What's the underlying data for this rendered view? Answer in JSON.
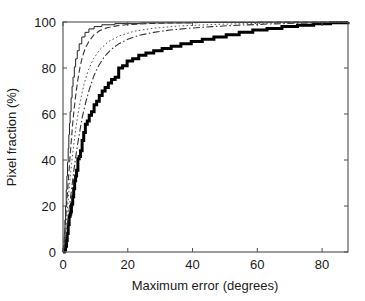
{
  "chart_data": {
    "type": "line",
    "title": "",
    "xlabel": "Maximum error (degrees)",
    "ylabel": "Pixel fraction (%)",
    "xlim": [
      0,
      88
    ],
    "ylim": [
      0,
      100
    ],
    "xticks": [
      0,
      20,
      40,
      60,
      80
    ],
    "yticks": [
      0,
      20,
      40,
      60,
      80,
      100
    ],
    "xticklabels": [
      "0",
      "20",
      "40",
      "60",
      "80"
    ],
    "yticklabels": [
      "0",
      "20",
      "40",
      "60",
      "80",
      "100"
    ],
    "grid": false,
    "legend": "none",
    "box": true,
    "series": [
      {
        "name": "thick-solid-staircase",
        "style": "solid",
        "width": 3.0,
        "color": "#000000",
        "step": true,
        "x": [
          0.0,
          0.4,
          0.8,
          1.1,
          1.3,
          1.6,
          1.9,
          2.2,
          2.4,
          2.6,
          2.8,
          3.0,
          3.3,
          3.6,
          3.9,
          4.2,
          4.6,
          5.0,
          5.4,
          5.9,
          6.4,
          6.9,
          7.5,
          8.1,
          8.8,
          9.6,
          10.4,
          11.2,
          12.1,
          13.0,
          14.0,
          15.0,
          16.1,
          17.2,
          18.4,
          19.8,
          21.5,
          23.4,
          25.6,
          28.0,
          30.6,
          33.4,
          36.4,
          39.6,
          43.0,
          46.6,
          50.4,
          54.4,
          58.6,
          63.0,
          67.6,
          72.4,
          77.4,
          82.6,
          88.0
        ],
        "y": [
          0.0,
          1.0,
          2.5,
          5.0,
          8.0,
          12.0,
          15.5,
          16.5,
          17.5,
          20.5,
          21.0,
          24.0,
          27.5,
          31.0,
          33.0,
          35.5,
          40.5,
          41.5,
          44.0,
          48.5,
          52.0,
          55.5,
          57.0,
          59.5,
          61.0,
          64.0,
          65.5,
          68.0,
          70.0,
          71.5,
          73.5,
          75.0,
          76.0,
          80.0,
          81.0,
          83.0,
          84.0,
          85.5,
          86.5,
          87.5,
          88.5,
          89.5,
          90.5,
          91.5,
          92.5,
          93.5,
          94.5,
          95.5,
          96.5,
          97.2,
          98.0,
          98.6,
          99.2,
          99.7,
          100.0
        ]
      },
      {
        "name": "thin-solid",
        "style": "solid",
        "width": 1.0,
        "color": "#222222",
        "step": true,
        "x": [
          0.0,
          0.2,
          0.4,
          0.6,
          0.8,
          1.0,
          1.2,
          1.4,
          1.6,
          1.8,
          2.0,
          2.2,
          2.5,
          2.8,
          3.1,
          3.5,
          3.9,
          4.4,
          5.0,
          5.8,
          6.8,
          8.0,
          9.6,
          12.0,
          16.0,
          24.0,
          40.0,
          60.0,
          88.0
        ],
        "y": [
          0.0,
          3.0,
          8.0,
          14.0,
          20.0,
          27.0,
          33.0,
          39.0,
          45.0,
          51.0,
          56.0,
          61.0,
          67.0,
          72.0,
          76.0,
          80.5,
          84.0,
          87.5,
          90.5,
          93.5,
          95.5,
          97.0,
          98.0,
          98.8,
          99.3,
          99.6,
          99.8,
          99.9,
          100.0
        ]
      },
      {
        "name": "dashed",
        "style": "dashed",
        "width": 1.1,
        "color": "#333333",
        "step": false,
        "x": [
          0.0,
          0.3,
          0.6,
          1.0,
          1.4,
          1.8,
          2.2,
          2.6,
          3.0,
          3.5,
          4.0,
          4.6,
          5.2,
          6.0,
          7.0,
          8.2,
          9.6,
          11.4,
          13.6,
          16.5,
          20.0,
          26.0,
          34.0,
          45.0,
          60.0,
          75.0,
          88.0
        ],
        "y": [
          0.0,
          4.0,
          10.0,
          18.0,
          26.0,
          34.0,
          42.0,
          49.0,
          56.0,
          63.0,
          69.0,
          75.0,
          80.0,
          85.0,
          89.0,
          92.0,
          94.5,
          96.3,
          97.5,
          98.3,
          98.9,
          99.3,
          99.6,
          99.8,
          99.9,
          99.95,
          100.0
        ]
      },
      {
        "name": "dash-dot",
        "style": "dashdot",
        "width": 1.1,
        "color": "#333333",
        "step": false,
        "x": [
          0.0,
          0.5,
          1.0,
          1.6,
          2.2,
          2.8,
          3.5,
          4.2,
          5.0,
          6.0,
          7.0,
          8.2,
          9.5,
          11.0,
          12.8,
          14.8,
          17.2,
          20.0,
          23.5,
          28.0,
          33.0,
          39.0,
          46.0,
          54.0,
          63.0,
          73.0,
          82.0,
          88.0
        ],
        "y": [
          0.0,
          3.0,
          8.0,
          15.0,
          22.0,
          29.0,
          37.0,
          44.0,
          51.0,
          59.0,
          65.0,
          71.0,
          76.5,
          81.0,
          85.0,
          88.0,
          90.5,
          92.5,
          94.2,
          95.5,
          96.5,
          97.3,
          98.0,
          98.6,
          99.1,
          99.5,
          99.8,
          100.0
        ]
      },
      {
        "name": "dotted",
        "style": "dotted",
        "width": 1.0,
        "color": "#555555",
        "step": false,
        "x": [
          0.0,
          0.4,
          0.8,
          1.3,
          1.8,
          2.4,
          3.0,
          3.7,
          4.5,
          5.4,
          6.5,
          7.8,
          9.4,
          11.4,
          14.0,
          17.5,
          22.0,
          28.0,
          36.0,
          48.0,
          64.0,
          80.0,
          88.0
        ],
        "y": [
          0.0,
          4.0,
          10.0,
          18.0,
          26.0,
          35.0,
          43.0,
          51.0,
          59.0,
          66.0,
          73.0,
          79.0,
          84.0,
          88.0,
          91.5,
          94.0,
          96.0,
          97.3,
          98.3,
          99.0,
          99.5,
          99.9,
          100.0
        ]
      }
    ]
  },
  "axes": {
    "ylabel": "Pixel fraction (%)",
    "xlabel": "Maximum error (degrees)",
    "xticklabels": [
      "0",
      "20",
      "40",
      "60",
      "80"
    ],
    "yticklabels": [
      "0",
      "20",
      "40",
      "60",
      "80",
      "100"
    ]
  },
  "colors": {
    "background": "#ffffff",
    "axis": "#4d4d4d",
    "text": "#1a1a1a",
    "primary_curve": "#000000"
  }
}
